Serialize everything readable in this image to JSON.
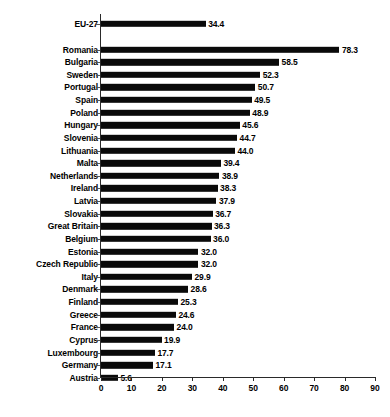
{
  "chart_data": {
    "type": "bar",
    "orientation": "horizontal",
    "title": "",
    "xlabel": "",
    "ylabel": "",
    "xlim": [
      0,
      90
    ],
    "xticks": [
      0,
      10,
      20,
      30,
      40,
      50,
      60,
      70,
      80,
      90
    ],
    "grid": false,
    "legend": null,
    "bar_color": "#0a0a0a",
    "categories": [
      "EU-27",
      "Romania",
      "Bulgaria",
      "Sweden",
      "Portugal",
      "Spain",
      "Poland",
      "Hungary",
      "Slovenia",
      "Lithuania",
      "Malta",
      "Netherlands",
      "Ireland",
      "Latvia",
      "Slovakia",
      "Great Britain",
      "Belgium",
      "Estonia",
      "Czech Republic",
      "Italy",
      "Denmark",
      "Finland",
      "Greece",
      "France",
      "Cyprus",
      "Luxembourg",
      "Germany",
      "Austria"
    ],
    "values": [
      34.4,
      78.3,
      58.5,
      52.3,
      50.7,
      49.5,
      48.9,
      45.6,
      44.7,
      44.0,
      39.4,
      38.9,
      38.3,
      37.9,
      36.7,
      36.3,
      36.0,
      32.0,
      32.0,
      29.9,
      28.6,
      25.3,
      24.6,
      24.0,
      19.9,
      17.7,
      17.1,
      5.6
    ],
    "value_labels": [
      "34.4",
      "78.3",
      "58.5",
      "52.3",
      "50.7",
      "49.5",
      "48.9",
      "45.6",
      "44.7",
      "44.0",
      "39.4",
      "38.9",
      "38.3",
      "37.9",
      "36.7",
      "36.3",
      "36.0",
      "32.0",
      "32.0",
      "29.9",
      "28.6",
      "25.3",
      "24.6",
      "24.0",
      "19.9",
      "17.7",
      "17.1",
      "5.6"
    ],
    "xtick_labels": [
      "0",
      "10",
      "20",
      "30",
      "40",
      "50",
      "60",
      "70",
      "80",
      "90"
    ],
    "separator_after_index": 0,
    "annotations": []
  },
  "caption": {
    "text": ""
  }
}
